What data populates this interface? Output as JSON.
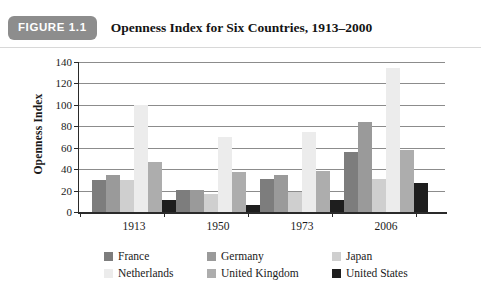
{
  "figure": {
    "badge": "FIGURE 1.1",
    "title": "Openness Index for Six Countries, 1913–2000"
  },
  "chart_data": {
    "type": "bar",
    "title": "Openness Index for Six Countries, 1913–2000",
    "xlabel": "",
    "ylabel": "Openness Index",
    "categories": [
      "1913",
      "1950",
      "1973",
      "2006"
    ],
    "ylim": [
      0,
      140
    ],
    "yticks": [
      0,
      20,
      40,
      60,
      80,
      100,
      120,
      140
    ],
    "grid": true,
    "legend_position": "bottom",
    "series": [
      {
        "name": "France",
        "color": "#7d7d7d",
        "values": [
          30,
          21,
          31,
          56
        ]
      },
      {
        "name": "Germany",
        "color": "#9a9a9a",
        "values": [
          35,
          21,
          35,
          84
        ]
      },
      {
        "name": "Japan",
        "color": "#cfcfcf",
        "values": [
          30,
          17,
          19,
          31
        ]
      },
      {
        "name": "Netherlands",
        "color": "#ececec",
        "values": [
          100,
          70,
          75,
          134
        ]
      },
      {
        "name": "United Kingdom",
        "color": "#adadad",
        "values": [
          47,
          37,
          38,
          58
        ]
      },
      {
        "name": "United States",
        "color": "#1e1e1e",
        "values": [
          11,
          7,
          11,
          27
        ]
      }
    ]
  }
}
